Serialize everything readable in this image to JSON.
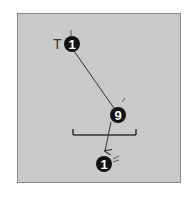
{
  "diagram": {
    "type": "billiards-shot-diagram",
    "background_color": "#c9c9c9",
    "border_color": "#8a8a8a",
    "labels": {
      "target_marker": "T"
    },
    "balls": [
      {
        "id": "ball-1-start",
        "number": "1",
        "x": 72,
        "y": 44
      },
      {
        "id": "ball-9",
        "number": "9",
        "x": 118,
        "y": 115
      },
      {
        "id": "ball-1-end",
        "number": "1",
        "x": 104,
        "y": 164
      }
    ],
    "path": {
      "from": [
        72,
        44
      ],
      "via": [
        118,
        115
      ],
      "to": [
        104,
        151
      ],
      "arrow": "end"
    },
    "bracket": {
      "x1": 73,
      "x2": 136,
      "y": 135,
      "tick_height": 6
    }
  }
}
